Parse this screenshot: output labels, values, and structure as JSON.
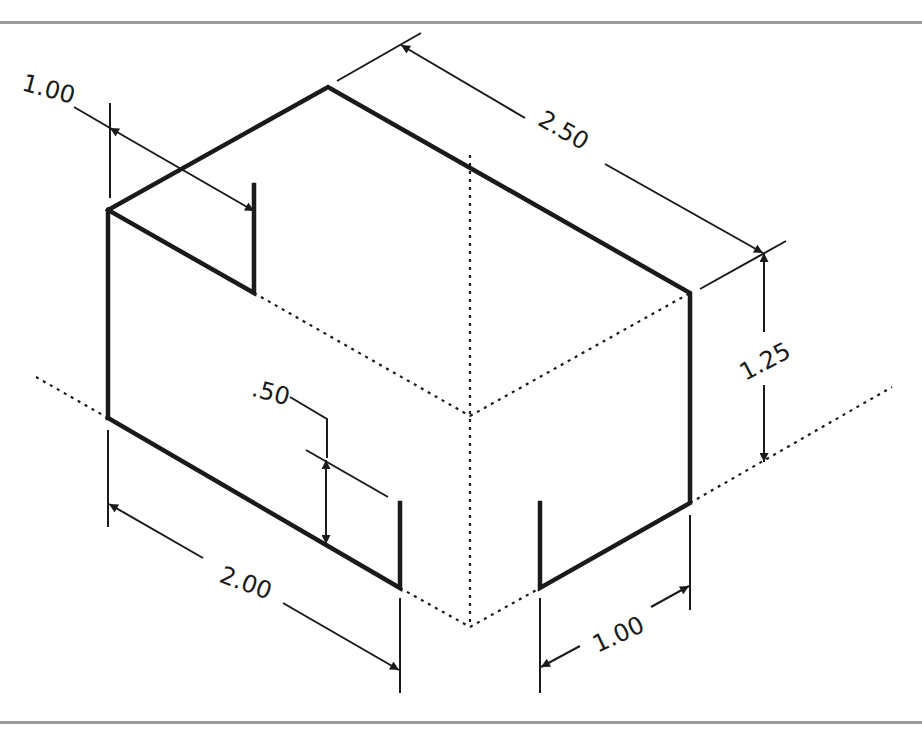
{
  "diagram": {
    "type": "isometric-dimensioned-drawing",
    "object": "rectangular block with notch",
    "colors": {
      "object_line": "#1a1a1a",
      "dimension_line": "#1a1a1a",
      "hidden_line": "#1a1a1a",
      "frame": "#9a9a9a",
      "background": "#ffffff"
    },
    "dimensions": {
      "notch_depth": "1.00",
      "length": "2.50",
      "height": "1.25",
      "notch_height": ".50",
      "width_left": "2.00",
      "width_right": "1.00"
    }
  }
}
